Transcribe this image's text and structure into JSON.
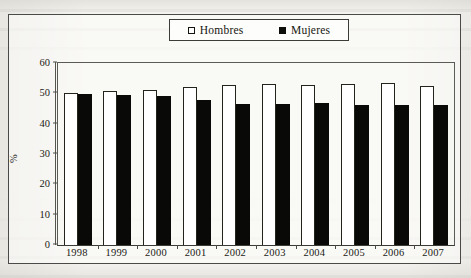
{
  "chart_data": {
    "type": "bar",
    "title": "",
    "xlabel": "",
    "ylabel": "%",
    "ylim": [
      0,
      60
    ],
    "yticks": [
      0,
      10,
      20,
      30,
      40,
      50,
      60
    ],
    "grid": false,
    "legend_position": "top-center",
    "categories": [
      "1998",
      "1999",
      "2000",
      "2001",
      "2002",
      "2003",
      "2004",
      "2005",
      "2006",
      "2007"
    ],
    "series": [
      {
        "name": "Hombres",
        "swatch": "hollow-square",
        "color": "#ffffff",
        "values": [
          50.2,
          50.7,
          51.0,
          52.2,
          52.7,
          53.0,
          52.9,
          53.2,
          53.3,
          52.4
        ]
      },
      {
        "name": "Mujeres",
        "swatch": "filled-square",
        "color": "#090907",
        "values": [
          49.8,
          49.3,
          49.0,
          47.8,
          46.6,
          46.5,
          46.8,
          46.2,
          46.0,
          46.2
        ]
      }
    ]
  },
  "legend": {
    "items": [
      {
        "label": "Hombres",
        "swatch": "hollow-square"
      },
      {
        "label": "Mujeres",
        "swatch": "filled-square"
      }
    ]
  },
  "axis": {
    "y_label": "%",
    "y_ticks": [
      "60",
      "50",
      "40",
      "30",
      "20",
      "10",
      "0"
    ],
    "x_ticks": [
      "1998",
      "1999",
      "2000",
      "2001",
      "2002",
      "2003",
      "2004",
      "2005",
      "2006",
      "2007"
    ]
  }
}
